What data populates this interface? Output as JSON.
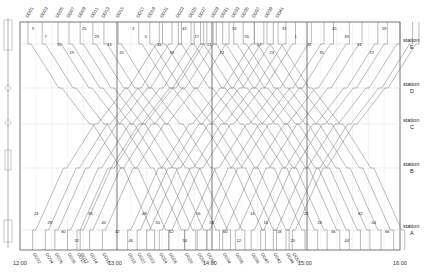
{
  "diagram": {
    "type": "train-timetable-graph",
    "time_axis": {
      "start": "12:00",
      "end": "16:00",
      "tick_labels": [
        "12:00",
        "13:00",
        "14:00",
        "15:00",
        "16:00"
      ]
    },
    "stations": [
      {
        "id": "E",
        "label": "station",
        "letter": "E"
      },
      {
        "id": "D",
        "label": "station",
        "letter": "D"
      },
      {
        "id": "C",
        "label": "station",
        "letter": "C"
      },
      {
        "id": "B",
        "label": "station",
        "letter": "B"
      },
      {
        "id": "A",
        "label": "station",
        "letter": "A"
      }
    ],
    "top_trains": [
      "DD01",
      "DD03",
      "DD05",
      "DD07",
      "DD09",
      "DD11",
      "DD13",
      "DD15",
      "DD17",
      "DD19",
      "DD21",
      "DD23",
      "DD25",
      "DD27",
      "DD29",
      "DD31",
      "DD33",
      "DD35",
      "DD37",
      "DD39",
      "DD41"
    ],
    "bottom_trains": [
      "DD02",
      "DD04",
      "DD06",
      "DD08",
      "DD10",
      "DD12",
      "DD14",
      "DD16",
      "DD18",
      "DD20",
      "DD22",
      "DD24",
      "DD26",
      "DD28",
      "DD30",
      "DD32",
      "DD34",
      "DD36",
      "DD38",
      "DD40",
      "DD42",
      "DD44",
      "DD50"
    ],
    "top_trains_depart_min": [
      5,
      14,
      24,
      31,
      38,
      46,
      53,
      62,
      75,
      82,
      90,
      100,
      108,
      114,
      122,
      128,
      135,
      141,
      148,
      156,
      163
    ],
    "bottom_trains_depart_min": [
      8,
      16,
      22,
      30,
      36,
      38,
      44,
      52,
      68,
      74,
      80,
      88,
      94,
      104,
      112,
      118,
      128,
      136,
      146,
      152,
      160,
      168,
      172
    ],
    "run_minutes": 78,
    "connection_labels_top": [
      "9",
      "7",
      "15",
      "19",
      "25",
      "29",
      "33",
      "41",
      "3",
      "5",
      "34",
      "39",
      "43",
      "17",
      "21",
      "13",
      "53",
      "55",
      "27",
      "23",
      "31",
      "1",
      "11",
      "35",
      "45",
      "49",
      "51",
      "57",
      "59"
    ],
    "connection_labels_bottom": [
      "24",
      "28",
      "30",
      "32",
      "38",
      "40",
      "42",
      "46",
      "48",
      "50",
      "52",
      "54",
      "56",
      "58",
      "60",
      "12",
      "14",
      "16",
      "18",
      "20",
      "22",
      "26",
      "36",
      "44",
      "62",
      "64",
      "66"
    ]
  }
}
